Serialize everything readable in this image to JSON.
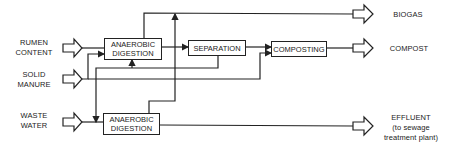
{
  "inputs": {
    "rumen_content": {
      "line1": "RUMEN",
      "line2": "CONTENT"
    },
    "solid_manure": {
      "line1": "SOLID",
      "line2": "MANURE"
    },
    "waste_water": {
      "line1": "WASTE",
      "line2": "WATER"
    }
  },
  "processes": {
    "digestion_top": {
      "line1": "ANAEROBIC",
      "line2": "DIGESTION"
    },
    "separation": {
      "label": "SEPARATION"
    },
    "composting": {
      "label": "COMPOSTING"
    },
    "digestion_bottom": {
      "line1": "ANAEROBIC",
      "line2": "DIGESTION"
    }
  },
  "outputs": {
    "biogas": {
      "label": "BIOGAS"
    },
    "compost": {
      "label": "COMPOST"
    },
    "effluent": {
      "line1": "EFFLUENT",
      "line2": "(to sewage",
      "line3": "treatment plant)"
    }
  },
  "colors": {
    "line": "#222222",
    "background": "#ffffff"
  }
}
